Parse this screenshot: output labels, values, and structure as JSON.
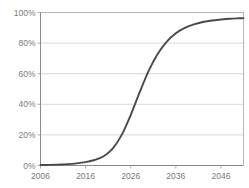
{
  "chart_data": {
    "type": "line",
    "title": "",
    "subtitle": "",
    "xlabel": "",
    "ylabel": "",
    "xlim": [
      2006,
      2051
    ],
    "ylim": [
      0,
      100
    ],
    "grid": "horizontal",
    "legend": "none",
    "x_tick_labels": [
      "2006",
      "2016",
      "2026",
      "2036",
      "2046"
    ],
    "x_tick_values": [
      2006,
      2016,
      2026,
      2036,
      2046
    ],
    "y_tick_labels": [
      "0%",
      "20%",
      "40%",
      "60%",
      "80%",
      "100%"
    ],
    "y_tick_values": [
      0,
      20,
      40,
      60,
      80,
      100
    ],
    "series": [
      {
        "name": "Adoption",
        "color": "#4a4a4a",
        "x": [
          2006,
          2008,
          2010,
          2012,
          2014,
          2016,
          2018,
          2020,
          2022,
          2024,
          2026,
          2028,
          2030,
          2032,
          2034,
          2036,
          2038,
          2040,
          2042,
          2044,
          2046,
          2048,
          2050,
          2051
        ],
        "values": [
          0.3,
          0.4,
          0.6,
          0.9,
          1.4,
          2.2,
          3.6,
          6.0,
          11.0,
          20.0,
          33.0,
          48.0,
          62.0,
          73.0,
          81.0,
          86.5,
          90.0,
          92.3,
          93.8,
          94.8,
          95.4,
          95.9,
          96.2,
          96.3
        ]
      }
    ]
  },
  "axis_colors": {
    "gridline": "#c8c8c8",
    "frame": "#b0b0b0",
    "tick_text": "#7a7a7a",
    "series": "#4a4a4a"
  }
}
